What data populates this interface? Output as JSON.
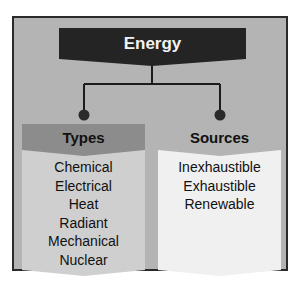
{
  "diagram": {
    "root": {
      "label": "Energy"
    },
    "branches": [
      {
        "title": "Types",
        "items": [
          "Chemical",
          "Electrical",
          "Heat",
          "Radiant",
          "Mechanical",
          "Nuclear"
        ]
      },
      {
        "title": "Sources",
        "items": [
          "Inexhaustible",
          "Exhaustible",
          "Renewable"
        ]
      }
    ]
  },
  "colors": {
    "frame_bg": "#b4b4b4",
    "frame_border": "#2a2a2a",
    "root_bg": "#242424",
    "types_header": "#8c8c8c",
    "types_body": "#cfcfcf",
    "sources_header": "#b4b4b4",
    "sources_body": "#f0f0f0"
  }
}
